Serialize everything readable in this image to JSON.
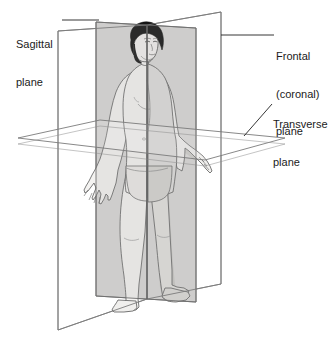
{
  "figure": {
    "background_color": "#ffffff",
    "line_color": "#6d6d6d",
    "text_color": "#1b1b1b"
  },
  "labels": {
    "sagittal": {
      "lines": [
        "Sagittal",
        "plane"
      ],
      "line1": "Sagittal",
      "line2": "plane",
      "leader": "horizontal-line-right"
    },
    "frontal": {
      "lines": [
        "Frontal",
        "(coronal)",
        "plane"
      ],
      "line1": "Frontal",
      "line2": "(coronal)",
      "line3": "plane",
      "leader": "horizontal-line-left"
    },
    "transverse": {
      "lines": [
        "Transverse",
        "plane"
      ],
      "line1": "Transverse",
      "line2": "plane",
      "leader": "diagonal-line-down-left"
    }
  },
  "planes": [
    {
      "name": "sagittal-plane",
      "label": "Sagittal plane",
      "orientation": "vertical, divides body into left and right",
      "fill": "none",
      "stroke": "#7a7a7a"
    },
    {
      "name": "frontal-plane",
      "label": "Frontal (coronal) plane",
      "orientation": "vertical, divides body into front and back",
      "fill": "#d8d8d8",
      "stroke": "#6b6b6b"
    },
    {
      "name": "transverse-plane",
      "label": "Transverse plane",
      "orientation": "horizontal, divides body into upper and lower",
      "fill": "none",
      "stroke": "#7a7a7a"
    }
  ],
  "body": {
    "skin_light": "#f3f2f0",
    "skin_shaded": "#cfcecb",
    "hair_color": "#151515",
    "outline": "#4a4a4a"
  }
}
